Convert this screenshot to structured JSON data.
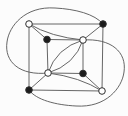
{
  "diagram": {
    "canvas": {
      "width": 128,
      "height": 116,
      "background": "#fcfcfc"
    },
    "colors": {
      "edge_stroke": "#555555",
      "vertex_black_fill": "#1c1c1c",
      "vertex_white_fill": "#ffffff",
      "vertex_outline": "#2e2e2e"
    },
    "style": {
      "edge_width": 0.9,
      "vertex_outline_width": 1.0,
      "vertex_radius": 3.3
    },
    "vertices": [
      {
        "id": "outer-top-left",
        "x": 29,
        "y": 24,
        "color": "white"
      },
      {
        "id": "outer-top-right",
        "x": 103,
        "y": 24,
        "color": "black"
      },
      {
        "id": "outer-bottom-left",
        "x": 29,
        "y": 90,
        "color": "black"
      },
      {
        "id": "outer-bottom-right",
        "x": 102,
        "y": 91,
        "color": "white"
      },
      {
        "id": "inner-top-left",
        "x": 47,
        "y": 39.5,
        "color": "black"
      },
      {
        "id": "inner-top-right",
        "x": 83,
        "y": 40,
        "color": "white"
      },
      {
        "id": "inner-bottom-left",
        "x": 48,
        "y": 73,
        "color": "white"
      },
      {
        "id": "inner-bottom-right",
        "x": 83,
        "y": 73.5,
        "color": "black"
      }
    ],
    "straight_edges": [
      {
        "id": "outer-top",
        "from": "outer-top-left",
        "to": "outer-top-right"
      },
      {
        "id": "outer-right",
        "from": "outer-top-right",
        "to": "outer-bottom-right"
      },
      {
        "id": "outer-bottom",
        "from": "outer-bottom-right",
        "to": "outer-bottom-left"
      },
      {
        "id": "outer-left",
        "from": "outer-bottom-left",
        "to": "outer-top-left"
      },
      {
        "id": "inner-top",
        "from": "inner-top-left",
        "to": "inner-top-right"
      },
      {
        "id": "inner-right",
        "from": "inner-top-right",
        "to": "inner-bottom-right"
      },
      {
        "id": "inner-bottom",
        "from": "inner-bottom-right",
        "to": "inner-bottom-left"
      },
      {
        "id": "inner-left",
        "from": "inner-bottom-left",
        "to": "inner-top-left"
      },
      {
        "id": "connector-top-left",
        "from": "outer-top-left",
        "to": "inner-top-left"
      },
      {
        "id": "connector-top-right",
        "from": "outer-top-right",
        "to": "inner-top-right"
      },
      {
        "id": "connector-bottom-left",
        "from": "outer-bottom-left",
        "to": "inner-bottom-left"
      },
      {
        "id": "connector-bottom-right",
        "from": "outer-bottom-right",
        "to": "inner-bottom-right"
      }
    ],
    "curved_edges": [
      {
        "id": "outside-arc-top-left",
        "path": "M 48,73 C 20,76 4,62 7,42 C 9,26 25,6 55,8 C 75,9 95,14 103,24"
      },
      {
        "id": "outside-arc-bottom-right",
        "path": "M 83,40 C 111,38 127,52 124,72 C 122,88 106,108 76,106 C 56,105 36,100 29,90"
      },
      {
        "id": "chord-arc-top",
        "path": "M 29,24 Q 51,37 83,40"
      },
      {
        "id": "chord-arc-bottom",
        "path": "M 102,91 Q 80,77 48,73"
      },
      {
        "id": "lens-arc-upper-left",
        "path": "M 83,40 Q 56,48 48,73"
      },
      {
        "id": "lens-arc-lower-right",
        "path": "M 48,73 Q 75,65 83,40"
      }
    ]
  }
}
